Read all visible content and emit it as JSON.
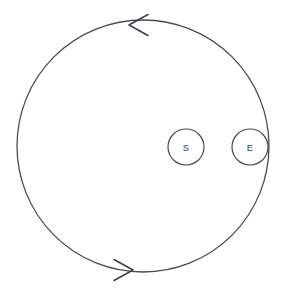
{
  "canvas": {
    "width": 284,
    "height": 292,
    "background_color": "#ffffff"
  },
  "diagram": {
    "stroke_color": "#4a4a52",
    "label_color": "#3f3f46"
  },
  "orbit": {
    "name": "orbit-circle",
    "center_x": 143,
    "center_y": 146,
    "radius": 126,
    "direction": "counter-clockwise",
    "stroke_width": 1.3
  },
  "arrows": [
    {
      "name": "top-arrowhead",
      "tip_x": 129,
      "tip_y": 25,
      "direction": "left",
      "position_on_orbit": "top"
    },
    {
      "name": "bottom-arrowhead",
      "tip_x": 133,
      "tip_y": 270,
      "direction": "right",
      "position_on_orbit": "bottom"
    }
  ],
  "nodes": [
    {
      "name": "node-s",
      "label": "S",
      "center_x": 186,
      "center_y": 147,
      "radius": 18,
      "on_orbit": false
    },
    {
      "name": "node-e",
      "label": "E",
      "center_x": 250,
      "center_y": 147,
      "radius": 18,
      "on_orbit": true
    }
  ]
}
